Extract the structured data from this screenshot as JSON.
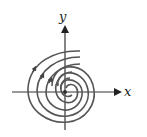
{
  "diagram": {
    "type": "phase-portrait",
    "axes": {
      "x_label": "x",
      "y_label": "y"
    },
    "trajectories": 4,
    "colors": {
      "axis": "#333333",
      "curve": "#555555",
      "background": "#ffffff"
    }
  }
}
